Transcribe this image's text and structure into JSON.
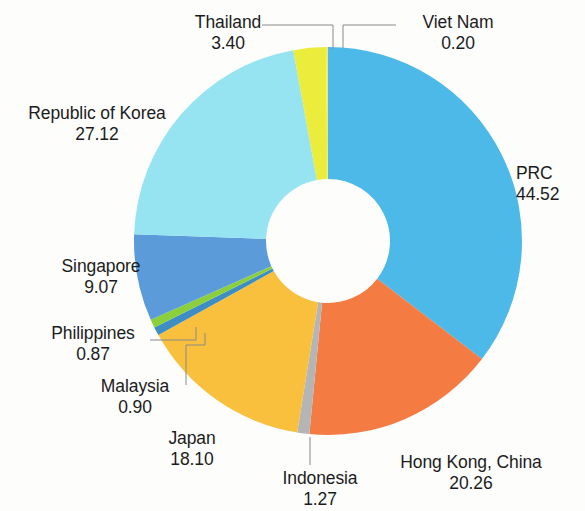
{
  "chart_data": {
    "type": "pie",
    "variant": "donut",
    "title": "",
    "subtitle": "",
    "xlabel": "",
    "ylabel": "",
    "grid": false,
    "legend_position": "outside-labels",
    "total": 125.71,
    "start_angle_deg": 0,
    "direction": "clockwise",
    "inner_radius_ratio": 0.32,
    "categories": [
      "PRC",
      "Hong Kong, China",
      "Indonesia",
      "Japan",
      "Malaysia",
      "Philippines",
      "Singapore",
      "Republic of Korea",
      "Thailand",
      "Viet Nam"
    ],
    "values": [
      44.52,
      20.26,
      1.27,
      18.1,
      0.9,
      0.87,
      9.07,
      27.12,
      3.4,
      0.2
    ],
    "value_labels": [
      "44.52",
      "20.26",
      "1.27",
      "18.10",
      "0.90",
      "0.87",
      "9.07",
      "27.12",
      "3.40",
      "0.20"
    ],
    "colors": [
      "#4cb9e8",
      "#f47b42",
      "#b5b5b5",
      "#f8c03c",
      "#3e8ec4",
      "#8ccf3c",
      "#5b9bd9",
      "#96e3f2",
      "#ecec3c",
      "#efe96a"
    ],
    "slices": [
      {
        "name": "PRC",
        "value": 44.52,
        "value_label": "44.52",
        "color": "#4cb9e8",
        "label_align": "left",
        "leader": false
      },
      {
        "name": "Hong Kong, China",
        "value": 20.26,
        "value_label": "20.26",
        "color": "#f47b42",
        "label_align": "center",
        "leader": false
      },
      {
        "name": "Indonesia",
        "value": 1.27,
        "value_label": "1.27",
        "color": "#b5b5b5",
        "label_align": "center",
        "leader": true
      },
      {
        "name": "Japan",
        "value": 18.1,
        "value_label": "18.10",
        "color": "#f8c03c",
        "label_align": "center",
        "leader": false
      },
      {
        "name": "Malaysia",
        "value": 0.9,
        "value_label": "0.90",
        "color": "#3e8ec4",
        "label_align": "center",
        "leader": true
      },
      {
        "name": "Philippines",
        "value": 0.87,
        "value_label": "0.87",
        "color": "#8ccf3c",
        "label_align": "center",
        "leader": true
      },
      {
        "name": "Singapore",
        "value": 9.07,
        "value_label": "9.07",
        "color": "#5b9bd9",
        "label_align": "center",
        "leader": false
      },
      {
        "name": "Republic of Korea",
        "value": 27.12,
        "value_label": "27.12",
        "color": "#96e3f2",
        "label_align": "center",
        "leader": false
      },
      {
        "name": "Thailand",
        "value": 3.4,
        "value_label": "3.40",
        "color": "#ecec3c",
        "label_align": "center",
        "leader": true
      },
      {
        "name": "Viet Nam",
        "value": 0.2,
        "value_label": "0.20",
        "color": "#efe96a",
        "label_align": "center",
        "leader": true
      }
    ]
  },
  "labels": {
    "thailand": {
      "name": "Thailand",
      "value": "3.40"
    },
    "vietnam": {
      "name": "Viet Nam",
      "value": "0.20"
    },
    "korea": {
      "name": "Republic of Korea",
      "value": "27.12"
    },
    "prc": {
      "name": "PRC",
      "value": "44.52"
    },
    "singapore": {
      "name": "Singapore",
      "value": "9.07"
    },
    "philippines": {
      "name": "Philippines",
      "value": "0.87"
    },
    "malaysia": {
      "name": "Malaysia",
      "value": "0.90"
    },
    "japan": {
      "name": "Japan",
      "value": "18.10"
    },
    "indonesia": {
      "name": "Indonesia",
      "value": "1.27"
    },
    "hongkong": {
      "name": "Hong Kong, China",
      "value": "20.26"
    }
  },
  "geometry": {
    "cx": 328,
    "cy": 241,
    "outer_r": 194,
    "inner_r": 62
  },
  "style": {
    "leader_color": "#8a8a8a",
    "background": "#fdfdfc",
    "text_color": "#1c1c1c"
  }
}
